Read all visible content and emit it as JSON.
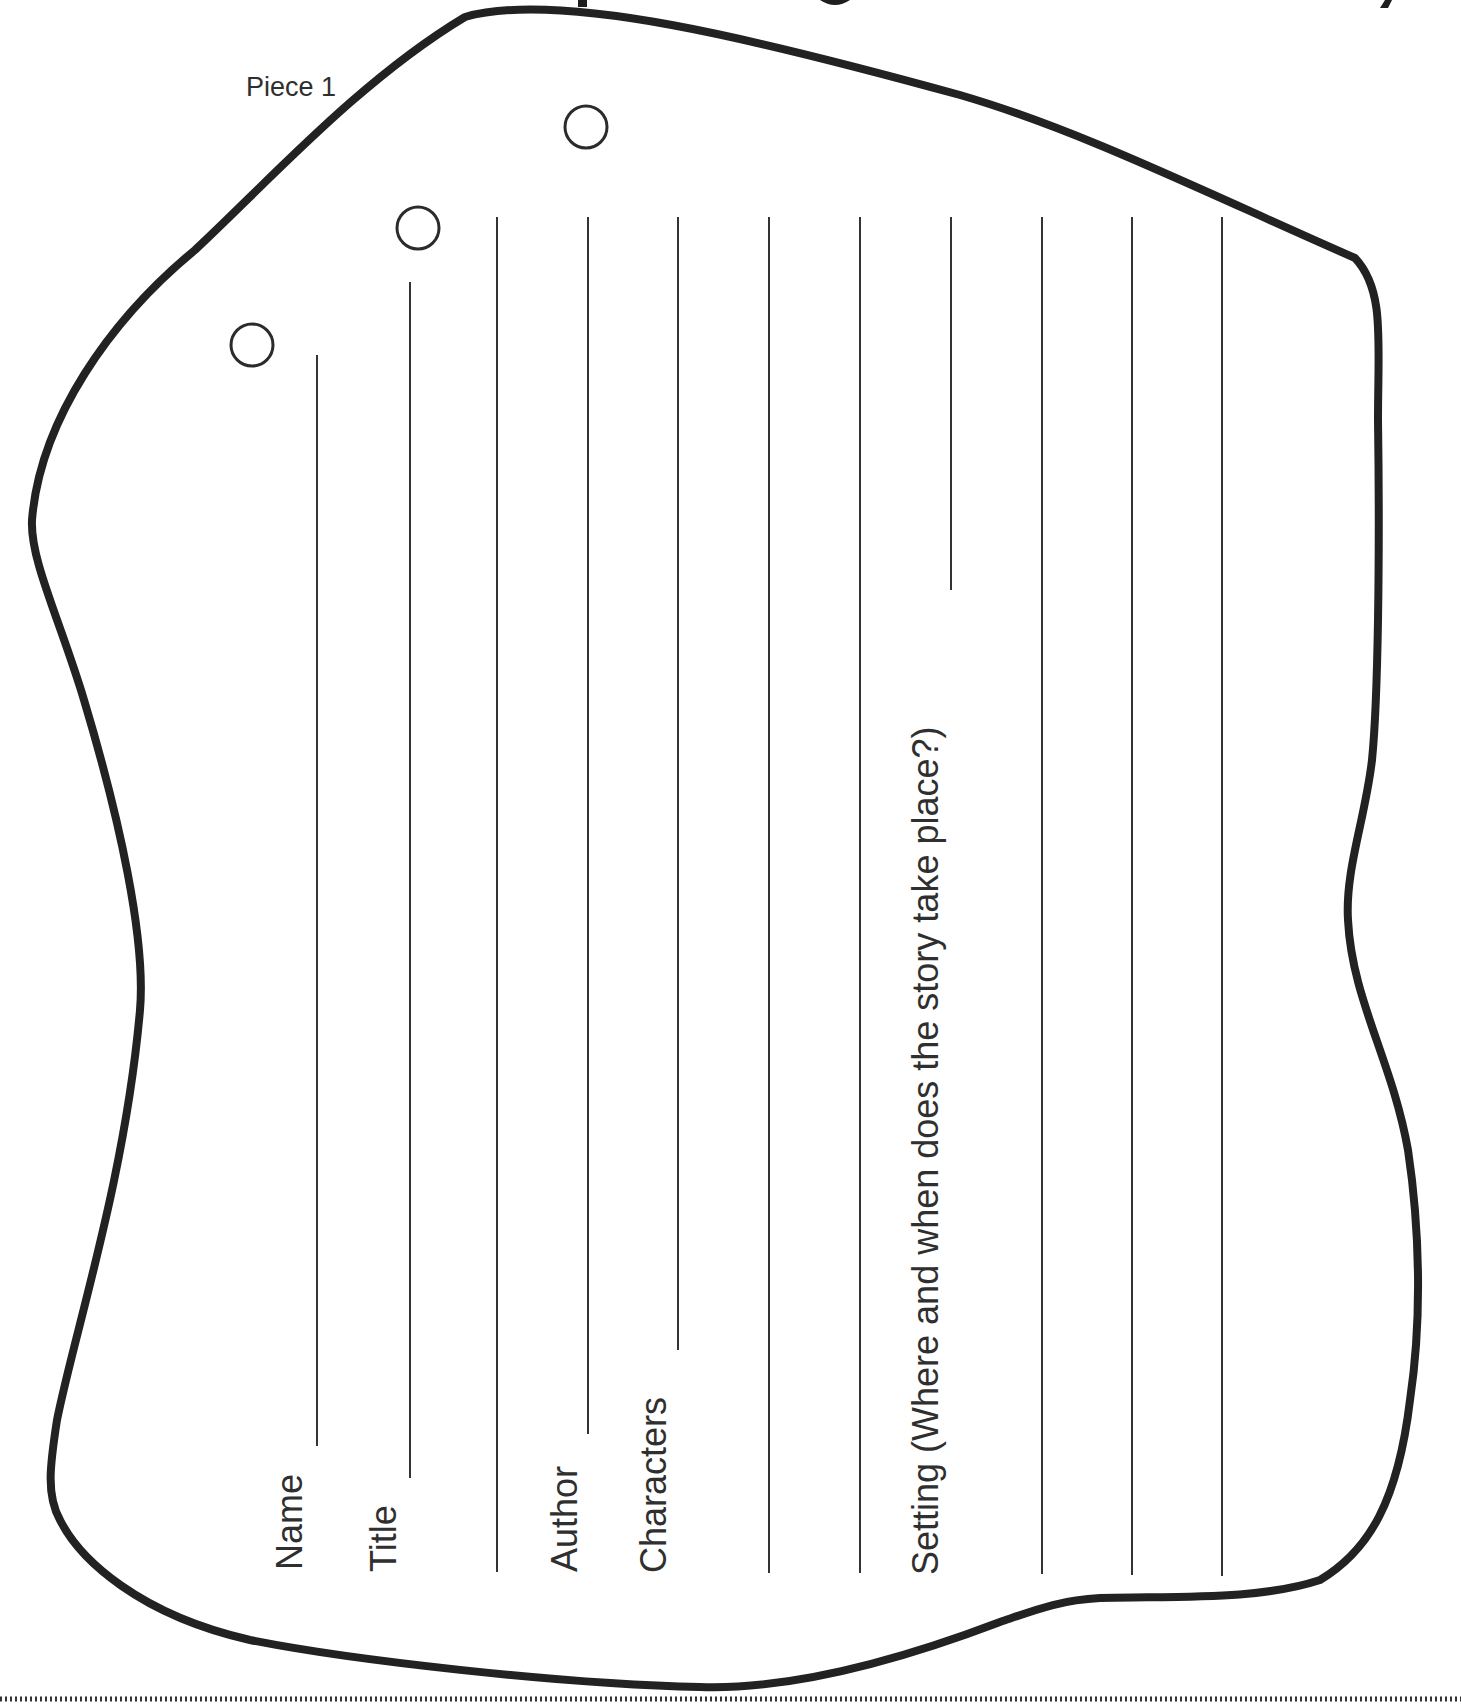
{
  "document": {
    "title_fragment": "",
    "piece_label": "Piece 1",
    "fields": [
      {
        "id": "name",
        "label": "Name",
        "x": 317,
        "line_top": 355,
        "line_bottom": 1446
      },
      {
        "id": "title",
        "label": "Title",
        "x": 410,
        "line_top": 282,
        "line_bottom": 1478
      },
      {
        "id": "title-line-2",
        "label": "",
        "x": 497,
        "line_top": 217,
        "line_bottom": 1572
      },
      {
        "id": "author",
        "label": "Author",
        "x": 588,
        "line_top": 217,
        "line_bottom": 1434
      },
      {
        "id": "characters",
        "label": "Characters",
        "x": 678,
        "line_top": 217,
        "line_bottom": 1350
      },
      {
        "id": "characters-line-2",
        "label": "",
        "x": 769,
        "line_top": 217,
        "line_bottom": 1573
      },
      {
        "id": "characters-line-3",
        "label": "",
        "x": 860,
        "line_top": 217,
        "line_bottom": 1573
      },
      {
        "id": "setting",
        "label": "Setting (Where and when does the story take place?)",
        "x": 951,
        "line_top": 217,
        "line_bottom": 590
      },
      {
        "id": "setting-line-2",
        "label": "",
        "x": 1042,
        "line_top": 217,
        "line_bottom": 1574
      },
      {
        "id": "setting-line-3",
        "label": "",
        "x": 1132,
        "line_top": 217,
        "line_bottom": 1575
      },
      {
        "id": "setting-line-4",
        "label": "",
        "x": 1222,
        "line_top": 217,
        "line_bottom": 1576
      }
    ],
    "holes": [
      {
        "cx": 252,
        "cy": 345,
        "r": 21
      },
      {
        "cx": 418,
        "cy": 228,
        "r": 21
      },
      {
        "cx": 586,
        "cy": 127,
        "r": 21
      }
    ],
    "cut_line": "dotted"
  },
  "colors": {
    "ink": "#2b2b2b",
    "outline": "#222222",
    "paper": "#ffffff"
  }
}
